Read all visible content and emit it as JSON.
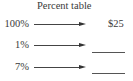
{
  "title": "Percent table",
  "rows": [
    {
      "percent": "100%",
      "value": "$25",
      "blank": false
    },
    {
      "percent": "1%",
      "value": "",
      "blank": true
    },
    {
      "percent": "7%",
      "value": "",
      "blank": true
    }
  ],
  "colors": {
    "text": "#3a3a3a",
    "arrow": "#444444",
    "background": "#ffffff"
  }
}
